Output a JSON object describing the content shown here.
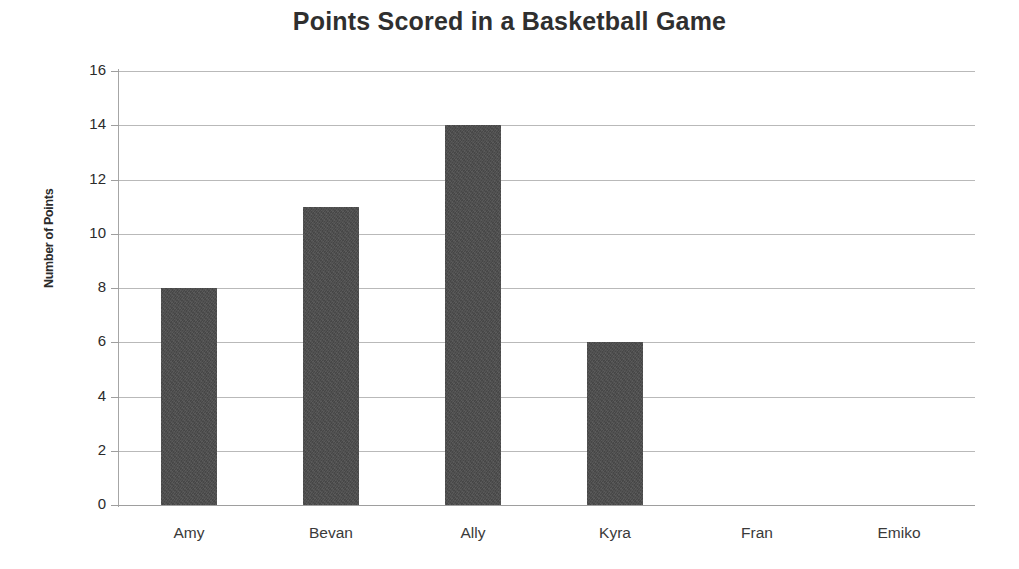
{
  "chart_data": {
    "type": "bar",
    "title": "Points Scored in a Basketball Game",
    "xlabel": "",
    "ylabel": "Number of Points",
    "categories": [
      "Amy",
      "Bevan",
      "Ally",
      "Kyra",
      "Fran",
      "Emiko"
    ],
    "values": [
      8,
      11,
      14,
      6,
      0,
      0
    ],
    "series": [
      {
        "name": "Number of Points",
        "values": [
          8,
          11,
          14,
          6,
          0,
          0
        ]
      }
    ],
    "ylim": [
      0,
      16
    ],
    "ytick_values": [
      0,
      2,
      4,
      6,
      8,
      10,
      12,
      14,
      16
    ],
    "ytick_labels": [
      "0",
      "2",
      "4",
      "6",
      "8",
      "10",
      "12",
      "14",
      "16"
    ],
    "ytick_step": 2,
    "grid": "horizontal",
    "legend": "none",
    "bar_color": "#4c4c4c",
    "gridline_color": "#b9b9b9",
    "axis_color": "#9e9e9e",
    "title_color": "#2f2f2f",
    "background_color": "#ffffff"
  }
}
